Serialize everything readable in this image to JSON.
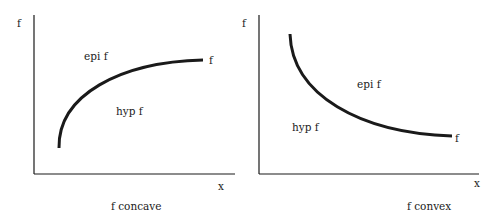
{
  "panels": [
    {
      "id": "concave",
      "y_axis_label": "f",
      "x_axis_label": "x",
      "curve_label": "f",
      "region_above": "epi f",
      "region_below": "hyp f",
      "caption": "f concave"
    },
    {
      "id": "convex",
      "y_axis_label": "f",
      "x_axis_label": "x",
      "curve_label": "f",
      "region_above": "epi f",
      "region_below": "hyp f",
      "caption": "f convex"
    }
  ],
  "colors": {
    "ink": "#1a1a1a",
    "background": "#ffffff"
  }
}
